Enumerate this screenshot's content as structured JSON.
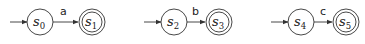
{
  "diagram": {
    "type": "finite-automata",
    "automata": [
      {
        "start": {
          "name": "s",
          "index": "0"
        },
        "accept": {
          "name": "s",
          "index": "1"
        },
        "transition_symbol": "a"
      },
      {
        "start": {
          "name": "s",
          "index": "2"
        },
        "accept": {
          "name": "s",
          "index": "3"
        },
        "transition_symbol": "b"
      },
      {
        "start": {
          "name": "s",
          "index": "4"
        },
        "accept": {
          "name": "s",
          "index": "5"
        },
        "transition_symbol": "c"
      }
    ],
    "colors": {
      "stroke": "#333333",
      "background": "#ffffff"
    }
  }
}
